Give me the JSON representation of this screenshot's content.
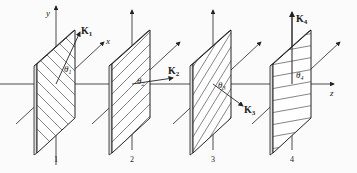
{
  "figure": {
    "axes": {
      "x_label": "x",
      "y_label": "y",
      "z_label": "z"
    },
    "plates": [
      {
        "number": "1",
        "vector": "K",
        "vector_sub": "1",
        "angle": "θ",
        "angle_sub": "1",
        "hatch": "backslash"
      },
      {
        "number": "2",
        "vector": "K",
        "vector_sub": "2",
        "angle": "θ",
        "angle_sub": "2",
        "hatch": "slash"
      },
      {
        "number": "3",
        "vector": "K",
        "vector_sub": "3",
        "angle": "θ",
        "angle_sub": "3",
        "hatch": "steep-slash"
      },
      {
        "number": "4",
        "vector": "K",
        "vector_sub": "4",
        "angle": "θ",
        "angle_sub": "4",
        "hatch": "horizontal"
      }
    ],
    "colors": {
      "line": "#222222",
      "background": "#fbfbfb"
    }
  }
}
